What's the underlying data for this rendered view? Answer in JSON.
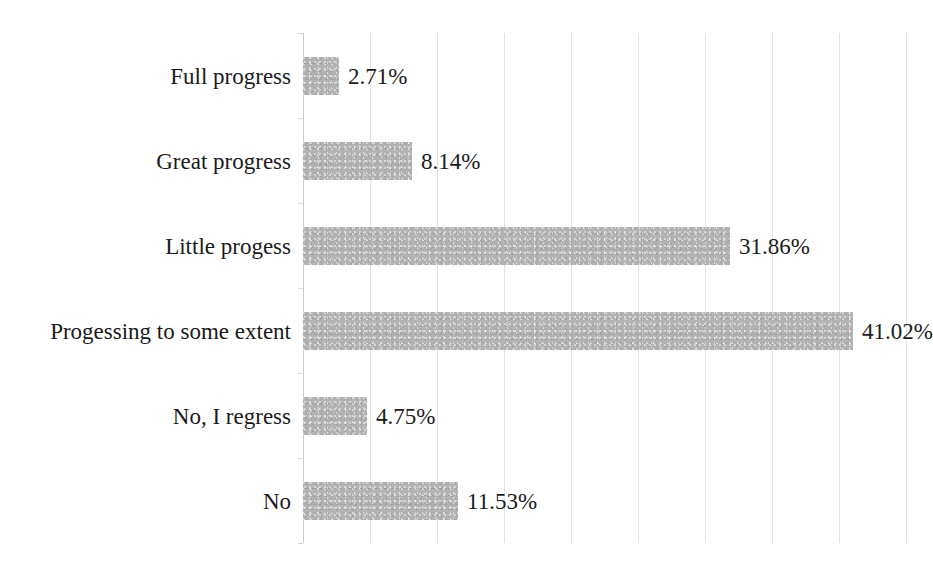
{
  "chart_data": {
    "type": "bar",
    "orientation": "horizontal",
    "title": "",
    "subtitle": "",
    "xlabel": "",
    "ylabel": "",
    "categories": [
      "Full progress",
      "Great progress",
      "Little progess",
      "Progessing to some extent",
      "No, I regress",
      "No"
    ],
    "values": [
      2.71,
      8.14,
      31.86,
      41.02,
      4.75,
      11.53
    ],
    "value_labels": [
      "2.71%",
      "8.14%",
      "31.86%",
      "41.02%",
      "4.75%",
      "11.53%"
    ],
    "units": "percent",
    "xlim": [
      0,
      45
    ],
    "ylim": null,
    "grid": true,
    "grid_axis": "x",
    "grid_interval": 5,
    "tick_values": [
      0,
      5,
      10,
      15,
      20,
      25,
      30,
      35,
      40,
      45
    ],
    "tick_labels": [
      "",
      "",
      "",
      "",
      "",
      "",
      "",
      "",
      "",
      ""
    ],
    "legend": null,
    "legend_position": "none",
    "annotations": [],
    "colors": {
      "bar_fill": "#b4b4b4",
      "gridline": "#e3e3e3",
      "axis_line": "#cccccc",
      "text": "#1c1c1c",
      "background": "#ffffff"
    }
  }
}
